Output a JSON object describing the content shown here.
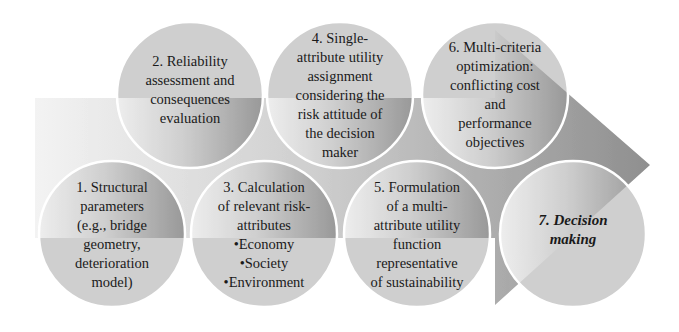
{
  "diagram": {
    "type": "process-flow",
    "direction": "left-to-right",
    "colors": {
      "background": "#ffffff",
      "arrow_light": "#efefef",
      "arrow_mid": "#c9c9c9",
      "arrow_dark": "#9a9a9a",
      "circle_light": "#cdcdcd",
      "circle_dark": "#a8a8a8",
      "circle_border": "#ffffff",
      "text": "#1a1a1a"
    },
    "steps": [
      {
        "id": 1,
        "text": "1. Structural\nparameters\n(e.g., bridge\ngeometry,\ndeterioration\nmodel)",
        "row": "bottom"
      },
      {
        "id": 2,
        "text": "2. Reliability\nassessment and\nconsequences\nevaluation",
        "row": "top"
      },
      {
        "id": 3,
        "text": "3. Calculation\nof relevant risk-\nattributes\n•Economy\n•Society\n•Environment",
        "row": "bottom"
      },
      {
        "id": 4,
        "text": "4. Single-\nattribute utility\nassignment\nconsidering the\nrisk attitude of\nthe decision\nmaker",
        "row": "top"
      },
      {
        "id": 5,
        "text": "5. Formulation\nof a multi-\nattribute utility\nfunction\nrepresentative\nof sustainability",
        "row": "bottom"
      },
      {
        "id": 6,
        "text": "6. Multi-criteria\noptimization:\nconflicting cost\nand\nperformance\nobjectives",
        "row": "top"
      },
      {
        "id": 7,
        "text": "7. Decision\nmaking",
        "row": "bottom",
        "emphasis": "bold-italic"
      }
    ]
  }
}
